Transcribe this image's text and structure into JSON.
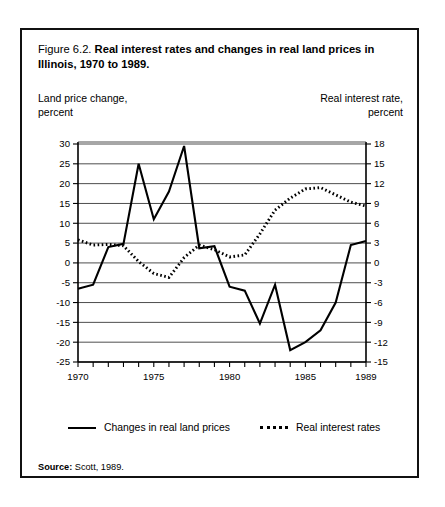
{
  "figure": {
    "label": "Figure 6.2.",
    "title": "Real interest rates and changes in real land prices in Illinois, 1970 to 1989.",
    "source_label": "Source:",
    "source_text": "Scott, 1989."
  },
  "axis_titles": {
    "left_line1": "Land price change,",
    "left_line2": "percent",
    "right_line1": "Real interest rate,",
    "right_line2": "percent"
  },
  "legend": {
    "solid_label": "Changes in real land prices",
    "dotted_label": "Real interest rates"
  },
  "chart_data": {
    "type": "line",
    "title": "Real interest rates and changes in real land prices in Illinois, 1970 to 1989.",
    "xlabel": "",
    "ylabel": "Land price change, percent",
    "y2label": "Real interest rate, percent",
    "xlim": [
      1970,
      1989
    ],
    "ylim": [
      -25,
      30
    ],
    "y2lim": [
      -15,
      18
    ],
    "grid": true,
    "legend_position": "below-axes",
    "x_tick_labels": [
      "1970",
      "1975",
      "1980",
      "1985",
      "1989"
    ],
    "x_tick_values": [
      1970,
      1975,
      1980,
      1985,
      1989
    ],
    "x_minor_ticks": [
      1970,
      1971,
      1972,
      1973,
      1974,
      1975,
      1976,
      1977,
      1978,
      1979,
      1980,
      1981,
      1982,
      1983,
      1984,
      1985,
      1986,
      1987,
      1988,
      1989
    ],
    "y_tick_labels": [
      "30",
      "25",
      "20",
      "15",
      "10",
      "5",
      "0",
      "-5",
      "-10",
      "-15",
      "-20",
      "-25"
    ],
    "y_tick_values": [
      30,
      25,
      20,
      15,
      10,
      5,
      0,
      -5,
      -10,
      -15,
      -20,
      -25
    ],
    "y2_tick_labels": [
      "18",
      "15",
      "12",
      "9",
      "6",
      "3",
      "0",
      "-3",
      "-6",
      "-9",
      "-12",
      "-15"
    ],
    "y2_tick_values": [
      18,
      15,
      12,
      9,
      6,
      3,
      0,
      -3,
      -6,
      -9,
      -12,
      -15
    ],
    "x": [
      1970,
      1971,
      1972,
      1973,
      1974,
      1975,
      1976,
      1977,
      1978,
      1979,
      1980,
      1981,
      1982,
      1983,
      1984,
      1985,
      1986,
      1987,
      1988,
      1989
    ],
    "series": [
      {
        "name": "Changes in real land prices",
        "axis": "left",
        "style": "solid",
        "values": [
          -6.5,
          -5.5,
          4.0,
          4.8,
          25.0,
          11.0,
          18.0,
          29.5,
          3.7,
          4.2,
          -6.0,
          -7.0,
          -15.3,
          -5.5,
          -22.0,
          -20.0,
          -17.0,
          -10.0,
          4.5,
          5.5
        ]
      },
      {
        "name": "Real interest rates",
        "axis": "right",
        "style": "dotted",
        "values": [
          3.5,
          2.7,
          2.8,
          2.6,
          0.2,
          -1.6,
          -2.2,
          0.8,
          2.7,
          2.0,
          0.9,
          1.2,
          4.4,
          8.0,
          9.8,
          11.2,
          11.4,
          10.3,
          9.2,
          8.6
        ]
      }
    ]
  }
}
